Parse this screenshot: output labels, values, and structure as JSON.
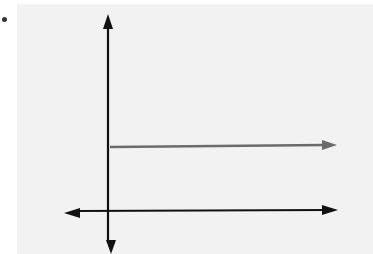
{
  "figure": {
    "bullet_color": "#333333",
    "panel_color": "#f2f2f2",
    "axis_color": "#111111",
    "ray_color": "#6b6b6b"
  },
  "diagram": {
    "type": "coordinate-plane-with-ray",
    "y_axis": {
      "x": 108,
      "y_top": 16,
      "y_bottom": 252,
      "arrows": [
        "up",
        "down"
      ]
    },
    "x_axis": {
      "y": 211,
      "x_left": 64,
      "x_right": 337,
      "arrows": [
        "left",
        "right"
      ]
    },
    "ray": {
      "y": 146,
      "x_start": 110,
      "x_end": 336,
      "direction": "right",
      "description": "horizontal ray starting on y-axis above origin"
    }
  }
}
